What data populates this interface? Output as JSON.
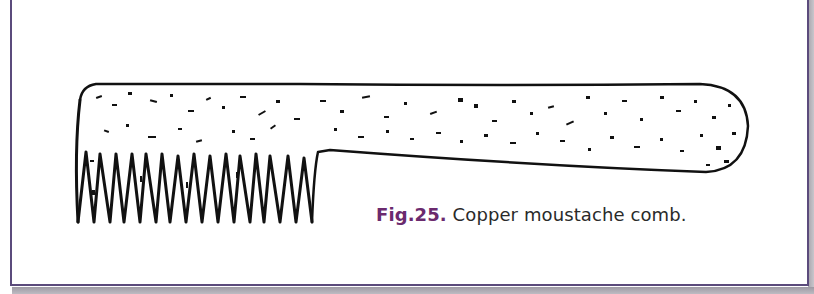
{
  "figure": {
    "label": "Fig.25.",
    "caption": " Copper moustache comb.",
    "colors": {
      "border": "#5b4b7c",
      "label": "#6b2a6e",
      "caption_text": "#2a2a2a",
      "ink": "#111111"
    }
  }
}
